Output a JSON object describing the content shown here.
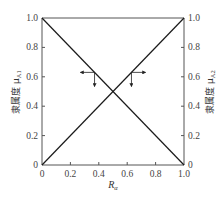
{
  "chart_data": {
    "type": "line",
    "title": "",
    "xlabel": "Rα",
    "xlabel_main": "R",
    "xlabel_sub": "α",
    "ylabel_left": "隶属度 μA1",
    "ylabel_left_main": "隶属度 μ",
    "ylabel_left_sub": "A1",
    "ylabel_right": "隶属度 μA2",
    "ylabel_right_main": "隶属度 μ",
    "ylabel_right_sub": "A2",
    "xlim": [
      0,
      1
    ],
    "ylim": [
      0,
      1
    ],
    "x_ticks": [
      "0",
      "0.2",
      "0.4",
      "0.6",
      "0.8",
      "1.0"
    ],
    "y_ticks_left": [
      "0",
      "0.2",
      "0.4",
      "0.6",
      "0.8",
      "1.0"
    ],
    "y_ticks_right": [
      "0",
      "0.2",
      "0.4",
      "0.6",
      "0.8",
      "1.0"
    ],
    "grid": false,
    "legend": null,
    "series": [
      {
        "name": "μA1 (decreasing)",
        "axis": "left",
        "x": [
          0,
          1
        ],
        "y": [
          1,
          0
        ]
      },
      {
        "name": "μA2 (increasing)",
        "axis": "right",
        "x": [
          0,
          1
        ],
        "y": [
          0,
          1
        ]
      }
    ],
    "intersection": {
      "x": 0.5,
      "y": 0.5
    },
    "annotations": [
      {
        "type": "arrow-marker",
        "on_series": "μA1 (decreasing)",
        "at": [
          0.37,
          0.63
        ],
        "arrows": [
          "left",
          "down"
        ]
      },
      {
        "type": "arrow-marker",
        "on_series": "μA2 (increasing)",
        "at": [
          0.63,
          0.63
        ],
        "arrows": [
          "right",
          "down"
        ]
      }
    ],
    "colors": {
      "line": "#1a1a1a",
      "axis": "#555555",
      "text": "#444444"
    }
  }
}
